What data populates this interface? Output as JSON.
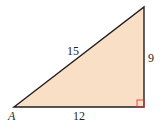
{
  "diagram": {
    "type": "right-triangle",
    "fill_color": "#f8dfc6",
    "stroke_color": "#231f20",
    "right_angle_marker_color": "#e0393e",
    "vertices": {
      "A": {
        "label": "A",
        "x": 14,
        "y": 107
      },
      "right": {
        "x": 144,
        "y": 107
      },
      "top": {
        "x": 144,
        "y": 7
      }
    },
    "sides": {
      "hypotenuse": {
        "label": "15"
      },
      "vertical": {
        "label": "9"
      },
      "base": {
        "label": "12"
      }
    }
  }
}
